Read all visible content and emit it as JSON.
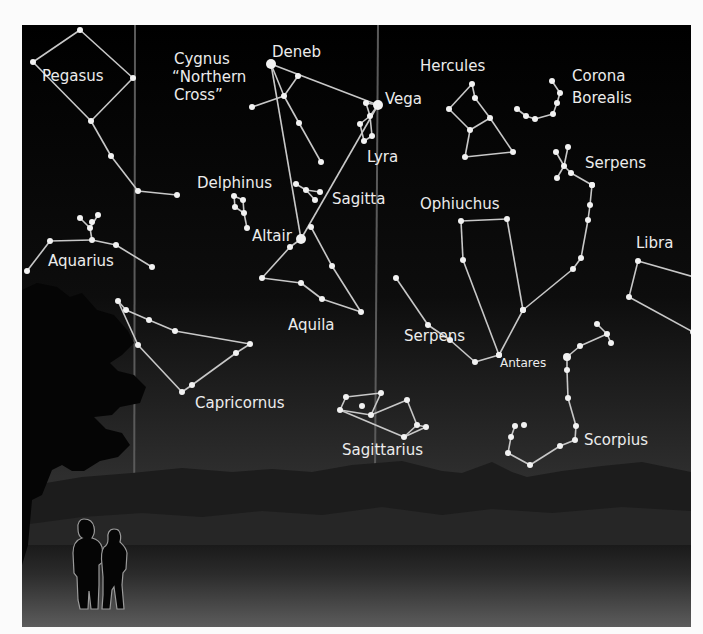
{
  "figure": {
    "frame": {
      "x": 22,
      "y": 25,
      "w": 669,
      "h": 602
    },
    "colors": {
      "sky_top": "#000000",
      "sky_bottom": "#3a3a3a",
      "ground_top": "#1e1e1e",
      "ground_bottom": "#5a5a5a",
      "star": "#f2f2f2",
      "line": "#c8c8c8",
      "label": "#ececec",
      "milky_way_edge": "#5a5a5a",
      "silhouette": "#050505"
    },
    "milky_way_edges": [
      {
        "x1": 113,
        "y1": 0,
        "x2": 112,
        "y2": 602
      },
      {
        "x1": 356,
        "y1": 0,
        "x2": 352,
        "y2": 602
      }
    ]
  },
  "labels": [
    {
      "id": "pegasus",
      "text": "Pegasus",
      "x": 20,
      "y": 56
    },
    {
      "id": "cygnus-1",
      "text": "Cygnus",
      "x": 152,
      "y": 39
    },
    {
      "id": "cygnus-2",
      "text": "“Northern",
      "x": 150,
      "y": 57
    },
    {
      "id": "cygnus-3",
      "text": "Cross”",
      "x": 152,
      "y": 75
    },
    {
      "id": "deneb",
      "text": "Deneb",
      "x": 250,
      "y": 32
    },
    {
      "id": "vega",
      "text": "Vega",
      "x": 363,
      "y": 79
    },
    {
      "id": "hercules",
      "text": "Hercules",
      "x": 398,
      "y": 46
    },
    {
      "id": "corona-1",
      "text": "Corona",
      "x": 550,
      "y": 56
    },
    {
      "id": "corona-2",
      "text": "Borealis",
      "x": 550,
      "y": 78
    },
    {
      "id": "lyra",
      "text": "Lyra",
      "x": 345,
      "y": 137
    },
    {
      "id": "serpens-caput",
      "text": "Serpens",
      "x": 563,
      "y": 143
    },
    {
      "id": "delphinus",
      "text": "Delphinus",
      "x": 175,
      "y": 163
    },
    {
      "id": "sagitta",
      "text": "Sagitta",
      "x": 310,
      "y": 179
    },
    {
      "id": "ophiuchus",
      "text": "Ophiuchus",
      "x": 398,
      "y": 184
    },
    {
      "id": "altair",
      "text": "Altair",
      "x": 230,
      "y": 216
    },
    {
      "id": "libra",
      "text": "Libra",
      "x": 614,
      "y": 223
    },
    {
      "id": "aquarius",
      "text": "Aquarius",
      "x": 26,
      "y": 241
    },
    {
      "id": "aquila",
      "text": "Aquila",
      "x": 266,
      "y": 305
    },
    {
      "id": "serpens-cauda",
      "text": "Serpens",
      "x": 382,
      "y": 316
    },
    {
      "id": "antares",
      "text": "Antares",
      "x": 478,
      "y": 342,
      "small": true
    },
    {
      "id": "capricornus",
      "text": "Capricornus",
      "x": 173,
      "y": 383
    },
    {
      "id": "scorpius",
      "text": "Scorpius",
      "x": 562,
      "y": 420
    },
    {
      "id": "sagittarius",
      "text": "Sagittarius",
      "x": 320,
      "y": 430
    }
  ],
  "constellations": [
    {
      "name": "Pegasus",
      "stars": [
        [
          58,
          5,
          3
        ],
        [
          11,
          37,
          3
        ],
        [
          111,
          53,
          3
        ],
        [
          69,
          96,
          3
        ],
        [
          89,
          131,
          3
        ],
        [
          116,
          166,
          3
        ],
        [
          155,
          170,
          3
        ]
      ],
      "lines": [
        [
          0,
          1
        ],
        [
          0,
          2
        ],
        [
          1,
          3
        ],
        [
          2,
          3
        ],
        [
          3,
          4
        ],
        [
          4,
          5
        ],
        [
          5,
          6
        ]
      ]
    },
    {
      "name": "Aquarius",
      "stars": [
        [
          58,
          193,
          3
        ],
        [
          76,
          190,
          3
        ],
        [
          68,
          203,
          3
        ],
        [
          70,
          197,
          3
        ],
        [
          28,
          216,
          3
        ],
        [
          70,
          215,
          3
        ],
        [
          94,
          220,
          3
        ],
        [
          130,
          242,
          3
        ],
        [
          5,
          246,
          3
        ]
      ],
      "lines": [
        [
          0,
          2
        ],
        [
          1,
          2
        ],
        [
          2,
          5
        ],
        [
          4,
          5
        ],
        [
          5,
          6
        ],
        [
          6,
          7
        ],
        [
          4,
          8
        ]
      ]
    },
    {
      "name": "Cygnus",
      "stars": [
        [
          249,
          39,
          5
        ],
        [
          276,
          51,
          3
        ],
        [
          262,
          71,
          3
        ],
        [
          230,
          82,
          3
        ],
        [
          277,
          98,
          3
        ],
        [
          299,
          137,
          3
        ]
      ],
      "lines": [
        [
          0,
          2
        ],
        [
          2,
          4
        ],
        [
          4,
          5
        ],
        [
          1,
          2
        ],
        [
          2,
          3
        ]
      ]
    },
    {
      "name": "Lyra",
      "stars": [
        [
          356,
          80,
          5
        ],
        [
          344,
          78,
          3
        ],
        [
          348,
          91,
          3
        ],
        [
          338,
          99,
          3
        ],
        [
          350,
          111,
          3
        ],
        [
          342,
          116,
          3
        ]
      ],
      "lines": [
        [
          0,
          1
        ],
        [
          0,
          2
        ],
        [
          2,
          3
        ],
        [
          3,
          5
        ],
        [
          2,
          4
        ],
        [
          4,
          5
        ],
        [
          1,
          2
        ]
      ]
    },
    {
      "name": "Delphinus",
      "stars": [
        [
          212,
          171,
          3
        ],
        [
          221,
          175,
          3
        ],
        [
          213,
          182,
          3
        ],
        [
          222,
          188,
          3
        ],
        [
          225,
          203,
          3
        ]
      ],
      "lines": [
        [
          0,
          1
        ],
        [
          0,
          2
        ],
        [
          1,
          3
        ],
        [
          2,
          3
        ],
        [
          3,
          4
        ]
      ]
    },
    {
      "name": "Sagitta",
      "stars": [
        [
          274,
          159,
          3
        ],
        [
          284,
          165,
          3
        ],
        [
          298,
          167,
          3
        ],
        [
          293,
          175,
          3
        ]
      ],
      "lines": [
        [
          0,
          1
        ],
        [
          1,
          2
        ],
        [
          1,
          3
        ]
      ]
    },
    {
      "name": "Aquila",
      "stars": [
        [
          279,
          214,
          5
        ],
        [
          289,
          202,
          3
        ],
        [
          268,
          222,
          3
        ],
        [
          240,
          253,
          3
        ],
        [
          279,
          258,
          3
        ],
        [
          300,
          274,
          3
        ],
        [
          310,
          241,
          3
        ],
        [
          339,
          287,
          3
        ]
      ],
      "lines": [
        [
          0,
          2
        ],
        [
          2,
          3
        ],
        [
          3,
          4
        ],
        [
          4,
          5
        ],
        [
          5,
          7
        ],
        [
          7,
          6
        ],
        [
          6,
          1
        ]
      ]
    },
    {
      "name": "Vega-Altair-Deneb",
      "stars": [
        [
          249,
          39,
          0
        ],
        [
          356,
          80,
          0
        ],
        [
          279,
          214,
          0
        ],
        [
          268,
          602,
          0
        ],
        [
          240,
          602,
          0
        ]
      ],
      "lines": [
        [
          0,
          1
        ],
        [
          1,
          2
        ],
        [
          0,
          2
        ]
      ]
    },
    {
      "name": "Capricornus",
      "stars": [
        [
          96,
          276,
          3
        ],
        [
          104,
          285,
          3
        ],
        [
          127,
          295,
          3
        ],
        [
          153,
          306,
          3
        ],
        [
          228,
          319,
          3
        ],
        [
          214,
          328,
          3
        ],
        [
          116,
          320,
          3
        ],
        [
          160,
          367,
          3
        ],
        [
          170,
          360,
          3
        ]
      ],
      "lines": [
        [
          0,
          1
        ],
        [
          1,
          2
        ],
        [
          2,
          3
        ],
        [
          3,
          4
        ],
        [
          4,
          5
        ],
        [
          5,
          8
        ],
        [
          8,
          7
        ],
        [
          0,
          6
        ],
        [
          6,
          7
        ]
      ]
    },
    {
      "name": "Hercules",
      "stars": [
        [
          450,
          59,
          3
        ],
        [
          453,
          73,
          3
        ],
        [
          427,
          84,
          3
        ],
        [
          468,
          93,
          3
        ],
        [
          448,
          105,
          3
        ],
        [
          491,
          127,
          3
        ],
        [
          443,
          132,
          3
        ]
      ],
      "lines": [
        [
          0,
          1
        ],
        [
          0,
          2
        ],
        [
          1,
          3
        ],
        [
          2,
          4
        ],
        [
          3,
          4
        ],
        [
          4,
          6
        ],
        [
          6,
          5
        ],
        [
          3,
          5
        ]
      ]
    },
    {
      "name": "Corona Borealis",
      "stars": [
        [
          530,
          56,
          3
        ],
        [
          538,
          68,
          3
        ],
        [
          535,
          78,
          3
        ],
        [
          531,
          89,
          3
        ],
        [
          513,
          94,
          3
        ],
        [
          504,
          91,
          3
        ],
        [
          495,
          84,
          3
        ]
      ],
      "lines": [
        [
          0,
          1
        ],
        [
          1,
          2
        ],
        [
          2,
          3
        ],
        [
          3,
          4
        ],
        [
          4,
          5
        ],
        [
          5,
          6
        ]
      ]
    },
    {
      "name": "Serpens Caput",
      "stars": [
        [
          534,
          127,
          3
        ],
        [
          546,
          122,
          3
        ],
        [
          542,
          141,
          3
        ],
        [
          535,
          153,
          3
        ],
        [
          549,
          148,
          3
        ],
        [
          570,
          160,
          3
        ]
      ],
      "lines": [
        [
          0,
          2
        ],
        [
          1,
          2
        ],
        [
          2,
          3
        ],
        [
          2,
          4
        ],
        [
          4,
          5
        ]
      ]
    },
    {
      "name": "Ophiuchus",
      "stars": [
        [
          439,
          196,
          3
        ],
        [
          485,
          194,
          3
        ],
        [
          441,
          235,
          3
        ],
        [
          501,
          285,
          3
        ],
        [
          477,
          330,
          3
        ]
      ],
      "lines": [
        [
          0,
          1
        ],
        [
          0,
          2
        ],
        [
          2,
          4
        ],
        [
          1,
          3
        ],
        [
          4,
          3
        ]
      ]
    },
    {
      "name": "Serpens Cauda",
      "stars": [
        [
          570,
          160,
          3
        ],
        [
          568,
          180,
          3
        ],
        [
          566,
          195,
          3
        ],
        [
          559,
          233,
          3
        ],
        [
          551,
          244,
          3
        ],
        [
          501,
          285,
          3
        ],
        [
          477,
          330,
          3
        ],
        [
          453,
          337,
          3
        ],
        [
          428,
          315,
          3
        ],
        [
          406,
          300,
          3
        ],
        [
          374,
          253,
          3
        ]
      ],
      "lines": [
        [
          0,
          1
        ],
        [
          1,
          2
        ],
        [
          2,
          3
        ],
        [
          3,
          4
        ],
        [
          4,
          5
        ],
        [
          6,
          7
        ],
        [
          7,
          8
        ],
        [
          8,
          9
        ],
        [
          9,
          10
        ]
      ]
    },
    {
      "name": "Libra",
      "stars": [
        [
          616,
          236,
          3
        ],
        [
          672,
          252,
          3
        ],
        [
          607,
          272,
          3
        ],
        [
          671,
          307,
          3
        ]
      ],
      "lines": [
        [
          0,
          1
        ],
        [
          0,
          2
        ],
        [
          1,
          3
        ],
        [
          2,
          3
        ]
      ]
    },
    {
      "name": "Scorpius",
      "stars": [
        [
          575,
          299,
          3
        ],
        [
          585,
          309,
          3
        ],
        [
          589,
          318,
          3
        ],
        [
          558,
          321,
          3
        ],
        [
          545,
          332,
          4
        ],
        [
          545,
          345,
          3
        ],
        [
          546,
          373,
          3
        ],
        [
          554,
          401,
          3
        ],
        [
          553,
          415,
          3
        ],
        [
          538,
          421,
          3
        ],
        [
          508,
          440,
          3
        ],
        [
          486,
          428,
          3
        ],
        [
          489,
          412,
          3
        ],
        [
          493,
          401,
          3
        ],
        [
          502,
          400,
          3
        ]
      ],
      "lines": [
        [
          0,
          1
        ],
        [
          1,
          2
        ],
        [
          1,
          3
        ],
        [
          3,
          4
        ],
        [
          4,
          5
        ],
        [
          5,
          6
        ],
        [
          6,
          7
        ],
        [
          7,
          8
        ],
        [
          8,
          9
        ],
        [
          9,
          10
        ],
        [
          10,
          11
        ],
        [
          11,
          12
        ],
        [
          12,
          13
        ]
      ]
    },
    {
      "name": "Sagittarius",
      "stars": [
        [
          359,
          368,
          3
        ],
        [
          340,
          381,
          3
        ],
        [
          324,
          372,
          3
        ],
        [
          349,
          390,
          3
        ],
        [
          385,
          375,
          3
        ],
        [
          395,
          400,
          3
        ],
        [
          404,
          402,
          3
        ],
        [
          382,
          412,
          3
        ],
        [
          318,
          385,
          3
        ],
        [
          402,
          377,
          0
        ]
      ],
      "lines": [
        [
          2,
          0
        ],
        [
          0,
          3
        ],
        [
          3,
          8
        ],
        [
          8,
          2
        ],
        [
          3,
          4
        ],
        [
          4,
          5
        ],
        [
          5,
          6
        ],
        [
          6,
          7
        ],
        [
          7,
          5
        ],
        [
          8,
          7
        ]
      ]
    }
  ],
  "scene": {
    "tree": "tree-silhouette",
    "mountains": "mountain-ridge",
    "people": "two-people-silhouette"
  }
}
